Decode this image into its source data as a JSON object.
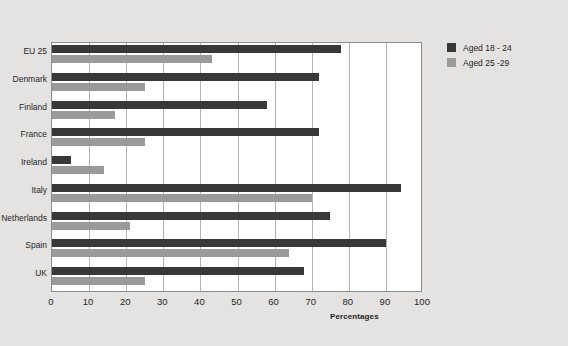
{
  "title": {
    "line1": "",
    "line2": "in different European countries, 2005"
  },
  "legend": {
    "position": "right",
    "items": [
      {
        "label": "Aged 18 - 24",
        "color": "#383838"
      },
      {
        "label": "Aged 25 -29",
        "color": "#9a9a9a"
      }
    ]
  },
  "axis": {
    "x_title": "Percentages",
    "ticks": [
      "0",
      "10",
      "20",
      "30",
      "40",
      "50",
      "60",
      "70",
      "80",
      "90",
      "100"
    ]
  },
  "chart_data": {
    "type": "bar",
    "orientation": "horizontal",
    "title": "in different European countries, 2005",
    "xlabel": "Percentages",
    "ylabel": "",
    "xlim": [
      0,
      100
    ],
    "xticks": [
      0,
      10,
      20,
      30,
      40,
      50,
      60,
      70,
      80,
      90,
      100
    ],
    "grid": true,
    "legend_position": "right",
    "categories": [
      "EU 25",
      "Denmark",
      "Finland",
      "France",
      "Ireland",
      "Italy",
      "Netherlands",
      "Spain",
      "UK"
    ],
    "series": [
      {
        "name": "Aged 18 - 24",
        "color": "#383838",
        "values": [
          78,
          72,
          58,
          72,
          5,
          94,
          75,
          90,
          68
        ]
      },
      {
        "name": "Aged 25 -29",
        "color": "#9a9a9a",
        "values": [
          43,
          25,
          17,
          25,
          14,
          70,
          21,
          64,
          25
        ]
      }
    ]
  }
}
